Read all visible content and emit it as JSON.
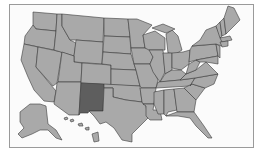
{
  "map": {
    "title": "United States map",
    "highlighted_state": "New Mexico",
    "colors": {
      "state_fill": "#a9a9a9",
      "highlight_fill": "#5e5e5e",
      "border": "#3a3a3a",
      "background": "#fbfbfb"
    },
    "insets": [
      "Alaska",
      "Hawaii"
    ]
  }
}
